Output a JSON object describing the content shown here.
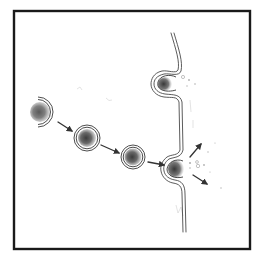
{
  "figure": {
    "width": 257,
    "height": 261,
    "colors": {
      "frame": "#1a1a1a",
      "membrane": "#4a4a4a",
      "vesicle_core": "#555555",
      "arrow": "#333333",
      "particle": "#9a9a9a"
    },
    "frame_rect": {
      "x": 14,
      "y": 11,
      "w": 236,
      "h": 238
    },
    "vesicles": [
      {
        "id": "vesicle-entering",
        "cx": 43,
        "cy": 112,
        "r": 15,
        "partial": true
      },
      {
        "id": "vesicle-2",
        "cx": 87,
        "cy": 138,
        "r": 13,
        "partial": false
      },
      {
        "id": "vesicle-3",
        "cx": 133,
        "cy": 157,
        "r": 12,
        "partial": false
      }
    ],
    "fused_vesicles": [
      {
        "id": "fused-top",
        "cx": 165,
        "cy": 83
      },
      {
        "id": "fused-bottom",
        "cx": 176,
        "cy": 168
      }
    ],
    "arrows": [
      {
        "id": "arrow-1",
        "x1": 58,
        "y1": 122,
        "x2": 72,
        "y2": 131
      },
      {
        "id": "arrow-2",
        "x1": 101,
        "y1": 145,
        "x2": 119,
        "y2": 153
      },
      {
        "id": "arrow-3",
        "x1": 148,
        "y1": 162,
        "x2": 164,
        "y2": 165
      },
      {
        "id": "arrow-release-up",
        "x1": 190,
        "y1": 157,
        "x2": 201,
        "y2": 144
      },
      {
        "id": "arrow-release-down",
        "x1": 193,
        "y1": 175,
        "x2": 207,
        "y2": 184
      }
    ],
    "particles": [
      {
        "cx": 183,
        "cy": 77,
        "r": 1.6
      },
      {
        "cx": 189,
        "cy": 80,
        "r": 0.9
      },
      {
        "cx": 195,
        "cy": 84,
        "r": 0.8
      },
      {
        "cx": 187,
        "cy": 86,
        "r": 0.7
      },
      {
        "cx": 190,
        "cy": 163,
        "r": 1.1
      },
      {
        "cx": 197,
        "cy": 162,
        "r": 1.4
      },
      {
        "cx": 198,
        "cy": 166,
        "r": 1.7
      },
      {
        "cx": 204,
        "cy": 165,
        "r": 0.9
      },
      {
        "cx": 190,
        "cy": 168,
        "r": 0.8
      },
      {
        "cx": 208,
        "cy": 152,
        "r": 0.7
      },
      {
        "cx": 215,
        "cy": 143,
        "r": 0.6
      },
      {
        "cx": 221,
        "cy": 188,
        "r": 0.7
      },
      {
        "cx": 210,
        "cy": 172,
        "r": 0.6
      }
    ]
  }
}
